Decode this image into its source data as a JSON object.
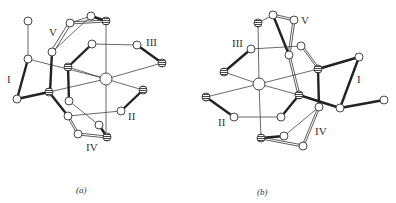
{
  "figure": {
    "panels": [
      {
        "id": "a",
        "caption": "(a)",
        "labels": {
          "I": "I",
          "II": "II",
          "III": "III",
          "IV": "IV",
          "V": "V"
        }
      },
      {
        "id": "b",
        "caption": "(b)",
        "labels": {
          "I": "I",
          "II": "II",
          "III": "III",
          "IV": "IV",
          "V": "V"
        }
      }
    ],
    "legend": {
      "open_circle": "atom (open)",
      "hatched_circle": "atom (hatched)",
      "large_circle": "central atom"
    }
  }
}
